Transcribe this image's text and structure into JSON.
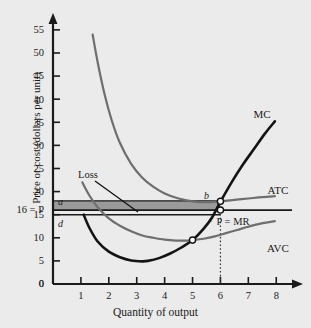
{
  "chart_data": {
    "type": "line",
    "title": "",
    "xlabel": "Quantity of output",
    "ylabel": "Price or cost (dollars per unit)",
    "xlim": [
      0,
      8.6
    ],
    "ylim": [
      0,
      58
    ],
    "grid": false,
    "legend_position": "right-inline",
    "xticks": [
      "1",
      "2",
      "3",
      "4",
      "5",
      "6",
      "7",
      "8"
    ],
    "xtick_values": [
      1,
      2,
      3,
      4,
      5,
      6,
      7,
      8
    ],
    "yticks": [
      "0",
      "5",
      "10",
      "15",
      "20",
      "25",
      "30",
      "35",
      "40",
      "45",
      "50",
      "55"
    ],
    "ytick_values": [
      0,
      5,
      10,
      15,
      20,
      25,
      30,
      35,
      40,
      45,
      50,
      55
    ],
    "price_label": "16 = P",
    "price_value": 16,
    "series": [
      {
        "name": "MC",
        "label": "MC",
        "color": "#141414",
        "x": [
          1.1,
          1.3,
          1.6,
          2.0,
          2.4,
          2.8,
          3.2,
          3.4,
          3.8,
          4.2,
          4.6,
          5.0,
          5.4,
          5.7,
          6.0,
          6.4,
          6.8,
          7.2,
          7.6,
          7.95
        ],
        "values": [
          15.0,
          12.2,
          9.2,
          7.0,
          5.8,
          5.1,
          4.9,
          5.0,
          5.6,
          6.6,
          7.9,
          9.5,
          12.0,
          14.4,
          17.8,
          22.0,
          25.8,
          29.2,
          32.6,
          35.2
        ]
      },
      {
        "name": "ATC",
        "label": "ATC",
        "color": "#6e6e6e",
        "x": [
          1.42,
          1.6,
          1.85,
          2.1,
          2.4,
          2.8,
          3.2,
          3.6,
          4.0,
          4.5,
          5.0,
          5.5,
          6.0,
          6.5,
          7.0,
          7.5,
          7.95
        ],
        "values": [
          54.0,
          48.0,
          41.0,
          35.5,
          30.5,
          26.0,
          23.0,
          21.0,
          19.6,
          18.5,
          17.9,
          17.7,
          17.9,
          18.2,
          18.5,
          18.8,
          19.0
        ]
      },
      {
        "name": "AVC",
        "label": "AVC",
        "color": "#6e6e6e",
        "x": [
          1.05,
          1.3,
          1.6,
          2.0,
          2.4,
          2.8,
          3.2,
          3.6,
          4.0,
          4.4,
          4.8,
          5.0,
          5.4,
          5.8,
          6.2,
          6.6,
          7.0,
          7.4,
          7.95
        ],
        "values": [
          22.0,
          19.2,
          16.6,
          14.2,
          12.6,
          11.4,
          10.5,
          10.0,
          9.6,
          9.4,
          9.4,
          9.5,
          9.8,
          10.3,
          11.0,
          11.7,
          12.4,
          13.0,
          13.6
        ]
      }
    ],
    "horizontal_lines": [
      {
        "name": "atc-at-q",
        "label": "a",
        "value": 18.0,
        "note": "line a-b: ATC at profit-maximizing output"
      },
      {
        "name": "price-mr",
        "label": "P = MR",
        "value": 16.0,
        "note": "price equals marginal revenue"
      },
      {
        "name": "avc-ref",
        "label": "d",
        "value": 15.0,
        "note": "lower reference line d-c"
      }
    ],
    "shaded_region": {
      "name": "Loss",
      "label": "Loss",
      "color": "#9a9a9a",
      "x_range": [
        0,
        6.0
      ],
      "y_range": [
        16.0,
        18.0
      ]
    },
    "point_markers": [
      {
        "label": "b",
        "x": 6.0,
        "y": 17.9,
        "note": "MC crosses ATC / top of loss rectangle"
      },
      {
        "label": "c",
        "x": 6.0,
        "y": 16.0,
        "note": "price = MR at chosen output"
      },
      {
        "label": "",
        "x": 5.0,
        "y": 9.5,
        "note": "MC crosses AVC at AVC minimum (shutdown point)"
      }
    ],
    "annotations": [
      {
        "name": "loss-callout",
        "text": "Loss",
        "x": 2.05,
        "y": 24.0
      },
      {
        "name": "output-dropline",
        "text": "",
        "x": 6.0,
        "note": "dotted vertical line from x-axis to point b"
      }
    ],
    "curve_labels": [
      {
        "name": "mc-label",
        "text": "MC"
      },
      {
        "name": "atc-label",
        "text": "ATC"
      },
      {
        "name": "avc-label",
        "text": "AVC"
      },
      {
        "name": "pmr-label",
        "text": "P = MR"
      }
    ],
    "axis_labels_inline": [
      {
        "name": "point-a-label",
        "text": "a"
      },
      {
        "name": "point-b-label",
        "text": "b"
      },
      {
        "name": "point-c-label",
        "text": "c"
      },
      {
        "name": "point-d-label",
        "text": "d"
      }
    ]
  },
  "colors": {
    "background": "#ebebeb",
    "axis": "#1a1a1a",
    "mc": "#141414",
    "atc_avc": "#6e6e6e",
    "loss_fill": "#9a9a9a",
    "text": "#1a1a1a"
  }
}
